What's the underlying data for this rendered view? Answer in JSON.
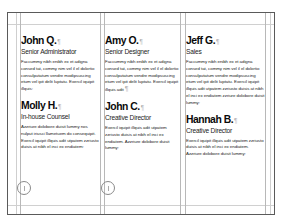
{
  "document": {
    "type": "page-layout-spread",
    "columns": [
      {
        "entries": [
          {
            "name": "John Q.",
            "pilcrow": "¶",
            "title": "Senior Administrator",
            "body": "Faccummy nibh enibh ex et adigna consed tat, commy nim vel il el dolortio consulputatum vendre modipsuscing etum vel ipit delit luptatu. Exercil iquipit illquis:"
          },
          {
            "name": "Molly H.",
            "pilcrow": "¶",
            "title": "In-house Counsel",
            "body": "Azzriure dolobore duisit lummy nos nulput iriusci llametuem do consequipit. Exercil iquipit illquis adit utpatem zzriusto duisis at nibh el inci ex endiatem:"
          }
        ]
      },
      {
        "entries": [
          {
            "name": "Amy O.",
            "pilcrow": "¶",
            "title": "Senior Designer",
            "body": "Faccummy nibh enibh ex et adigna consed tat, commy nim vel il el dolortio consulputatum vendre modipsuscing etum vel ipit delit luptatu. Exercil iquipit illquis adit",
            "end_pilcrow": "¶"
          },
          {
            "name": "John C.",
            "pilcrow": "¶",
            "title": "Creative Director",
            "body": "Exercil iquipit illquis adit utpatem zzriusto duisis at nibh el inci ex endiatem. Azzriure dolobore duisit lummy:"
          }
        ]
      },
      {
        "entries": [
          {
            "name": "Jeff G.",
            "pilcrow": "¶",
            "title": "Sales",
            "body": "Faccummy nibh enibh ex et adigna consed tat, commy nim vel il el dolortio consulputatum vendre modipsuscing etum vel ipit delit luptatu. Exercil iquipit illquis adit utpatem zzriusto duisis at nibh el inci ex endiatem zzriure dolobore duisit lummy:"
          },
          {
            "name": "Hannah B.",
            "pilcrow": "¶",
            "title": "Creative Director",
            "body": "Exercil iquipit illquis adit utpatem zzriusto duisis at nibh el inci ex endiatem. Azzriure dolobore duisit lummy:"
          }
        ]
      }
    ],
    "colors": {
      "page_border": "#5a5a5a",
      "guide": "#d0d0d0",
      "text": "#111111",
      "pilcrow": "#b0b0b0",
      "port_circle": "#8a8a8a"
    }
  }
}
